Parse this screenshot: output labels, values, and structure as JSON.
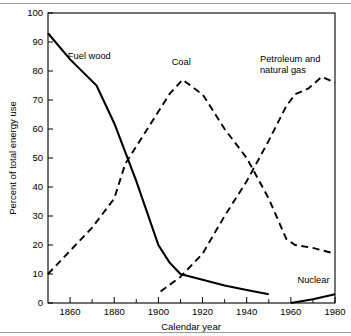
{
  "chart_data": {
    "type": "line",
    "title": "",
    "xlabel": "Calendar year",
    "ylabel": "Percent of total energy use",
    "xlim": [
      1850,
      1980
    ],
    "ylim": [
      0,
      100
    ],
    "grid": false,
    "legend_position": "inline-annotations",
    "x_ticks_major": [
      1860,
      1880,
      1900,
      1920,
      1940,
      1960,
      1980
    ],
    "x_ticks_minor": [
      1850,
      1870,
      1890,
      1910,
      1930,
      1950,
      1970
    ],
    "x_tick_labels": [
      "1860",
      "1880",
      "1900",
      "1920",
      "1940",
      "1960",
      "1980"
    ],
    "y_ticks": [
      0,
      10,
      20,
      30,
      40,
      50,
      60,
      70,
      80,
      90,
      100
    ],
    "y_tick_labels": [
      "0",
      "10",
      "20",
      "30",
      "40",
      "50",
      "60",
      "70",
      "80",
      "90",
      "100"
    ],
    "series": [
      {
        "name": "Fuel wood",
        "style": "solid",
        "label": "Fuel wood",
        "label_x": 1859,
        "label_y": 84,
        "x": [
          1850,
          1860,
          1872,
          1880,
          1890,
          1900,
          1905,
          1910,
          1920,
          1930,
          1940,
          1950
        ],
        "y": [
          93,
          84,
          75,
          62,
          42,
          20,
          14,
          10,
          8,
          6,
          4.5,
          3
        ]
      },
      {
        "name": "Coal",
        "style": "dashed",
        "label": "Coal",
        "label_x": 1906,
        "label_y": 82,
        "x": [
          1850,
          1860,
          1870,
          1880,
          1885,
          1890,
          1900,
          1905,
          1911,
          1918,
          1920,
          1930,
          1940,
          1950,
          1958,
          1962,
          1970,
          1980
        ],
        "y": [
          10,
          18,
          26,
          36,
          48,
          54,
          66,
          72,
          77,
          73,
          72,
          60,
          50,
          36,
          22,
          20,
          19,
          17
        ]
      },
      {
        "name": "Petroleum and natural gas",
        "style": "dashed",
        "label": "Petroleum and\nnatural gas",
        "label_x": 1946,
        "label_y": 83,
        "x": [
          1901,
          1910,
          1920,
          1930,
          1940,
          1950,
          1958,
          1962,
          1968,
          1974,
          1980
        ],
        "y": [
          4,
          9,
          17,
          30,
          42,
          56,
          68,
          72,
          74,
          78,
          76
        ]
      },
      {
        "name": "Nuclear",
        "style": "solid",
        "label": "Nuclear",
        "label_x": 1963,
        "label_y": 7,
        "x": [
          1960,
          1970,
          1980
        ],
        "y": [
          0,
          1.3,
          3
        ]
      }
    ]
  },
  "axis": {
    "x_title": "Calendar year",
    "y_title": "Percent of total energy use"
  }
}
